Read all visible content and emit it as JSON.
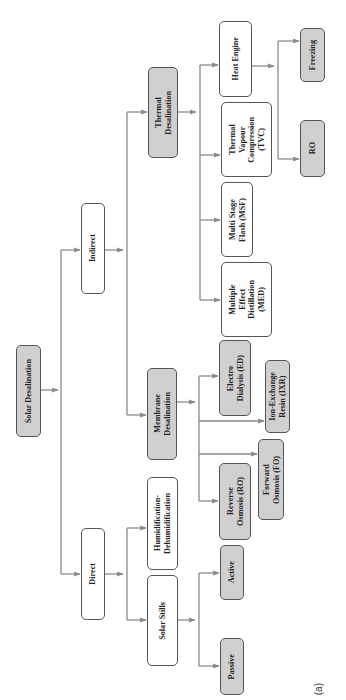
{
  "diagram": {
    "caption": "(a)",
    "colors": {
      "gray_fill": "#d0d0d0",
      "white_fill": "#ffffff",
      "border": "#555555",
      "connector": "#8a8a8a"
    },
    "orientation": "rotated 90deg counter-clockwise (text reads bottom-to-top)",
    "nodes": {
      "root": {
        "label": "Solar Desalination",
        "fill": "gray"
      },
      "direct": {
        "label": "Direct",
        "fill": "white"
      },
      "indirect": {
        "label": "Indirect",
        "fill": "white"
      },
      "solar_stills": {
        "label": "Solar Stills",
        "fill": "white"
      },
      "hdh": {
        "label": "Humidification-\nDehumidification",
        "fill": "white"
      },
      "membrane": {
        "label": "Membrane\nDesalination",
        "fill": "gray"
      },
      "thermal": {
        "label": "Thermal\nDesalination",
        "fill": "gray"
      },
      "passive": {
        "label": "Passive",
        "fill": "gray"
      },
      "active": {
        "label": "Active",
        "fill": "gray"
      },
      "ro": {
        "label": "Reverse\nOsmosis (RO)",
        "fill": "gray"
      },
      "fo": {
        "label": "Forward\nOsmosis (FO)",
        "fill": "gray"
      },
      "ed": {
        "label": "Electro\nDialysis (ED)",
        "fill": "gray"
      },
      "ixr": {
        "label": "Ion-Exchange\nResin (IXR)",
        "fill": "gray"
      },
      "med": {
        "label": "Multiple\nEffect\nDistillation\n(MED)",
        "fill": "white"
      },
      "msf": {
        "label": "Multi Stage\nFlash (MSF)",
        "fill": "white"
      },
      "tvc": {
        "label": "Thermal\nVapour\nCompression\n(TVC)",
        "fill": "white"
      },
      "heat_engine": {
        "label": "Heat Engine",
        "fill": "white"
      },
      "he_ro": {
        "label": "RO",
        "fill": "gray"
      },
      "freezing": {
        "label": "Freezing",
        "fill": "gray"
      }
    },
    "edges": [
      [
        "root",
        "direct"
      ],
      [
        "root",
        "indirect"
      ],
      [
        "direct",
        "solar_stills"
      ],
      [
        "direct",
        "hdh"
      ],
      [
        "indirect",
        "membrane"
      ],
      [
        "indirect",
        "thermal"
      ],
      [
        "solar_stills",
        "passive"
      ],
      [
        "solar_stills",
        "active"
      ],
      [
        "membrane",
        "ro"
      ],
      [
        "membrane",
        "fo"
      ],
      [
        "membrane",
        "ixr"
      ],
      [
        "membrane",
        "ed"
      ],
      [
        "thermal",
        "med"
      ],
      [
        "thermal",
        "msf"
      ],
      [
        "thermal",
        "tvc"
      ],
      [
        "thermal",
        "heat_engine"
      ],
      [
        "heat_engine",
        "he_ro"
      ],
      [
        "heat_engine",
        "freezing"
      ]
    ]
  }
}
